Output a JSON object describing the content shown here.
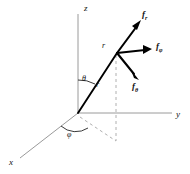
{
  "figure": {
    "axes": {
      "z_label": "z",
      "y_label": "y",
      "x_label": "x"
    },
    "angles": {
      "theta_label": "θ",
      "phi_label": "φ"
    },
    "radial": {
      "tip_label": "r",
      "mid_label": "r"
    },
    "forces": [
      {
        "name": "f-radial",
        "base": "f",
        "subscript": "r",
        "direction": "up-right"
      },
      {
        "name": "f-phi",
        "base": "f",
        "subscript": "φ",
        "direction": "right"
      },
      {
        "name": "f-theta",
        "base": "f",
        "subscript": "θ",
        "direction": "down-right"
      }
    ],
    "colors": {
      "axis": "#9a9a9a",
      "vector": "#000000",
      "dashed": "#b0b0b0",
      "background": "#ffffff"
    }
  }
}
